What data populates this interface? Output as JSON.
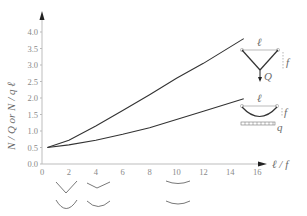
{
  "chart_data": {
    "type": "line",
    "title": "",
    "xlabel": "ℓ / f",
    "ylabel": "N / Q or N / q ℓ",
    "xlim": [
      0,
      16.5
    ],
    "ylim": [
      0,
      4.5
    ],
    "x_ticks": [
      "0",
      "2",
      "4",
      "6",
      "8",
      "10",
      "12",
      "14",
      "16"
    ],
    "y_ticks": [
      "0.0",
      "0.5",
      "1.0",
      "1.5",
      "2.0",
      "2.5",
      "3.0",
      "3.5",
      "4.0"
    ],
    "grid": false,
    "series": [
      {
        "name": "Point load Q (triangular truss)",
        "x": [
          0.4,
          2,
          4,
          6,
          8,
          10,
          12,
          15
        ],
        "y": [
          0.5,
          0.72,
          1.15,
          1.62,
          2.1,
          2.6,
          3.05,
          3.8
        ]
      },
      {
        "name": "Uniform load q (parabolic arch)",
        "x": [
          0.4,
          2,
          4,
          6,
          8,
          10,
          12,
          15
        ],
        "y": [
          0.5,
          0.58,
          0.72,
          0.9,
          1.1,
          1.35,
          1.6,
          1.98
        ]
      }
    ],
    "annotations": [
      {
        "text": "ℓ",
        "role": "span"
      },
      {
        "text": "f",
        "role": "rise"
      },
      {
        "text": "Q",
        "role": "point-load"
      },
      {
        "text": "q",
        "role": "distributed-load"
      }
    ]
  },
  "labels": {
    "xlabel": "ℓ / f",
    "ylabel": "N / Q or N / q ℓ",
    "ell": "ℓ",
    "f": "f",
    "Q": "Q",
    "q": "q"
  }
}
